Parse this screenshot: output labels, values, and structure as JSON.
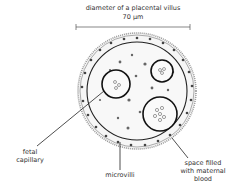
{
  "title": "diameter of a placental villus",
  "dimension": "70 µm",
  "labels": {
    "fetal_capillary": [
      "fetal",
      "capillary"
    ],
    "microvilli": "microvilli",
    "maternal_blood": [
      "space filled",
      "with maternal",
      "blood"
    ]
  },
  "colors": {
    "ink": "#333333",
    "stipple": "#8a8a8a",
    "fill": "#f3f3f3"
  }
}
